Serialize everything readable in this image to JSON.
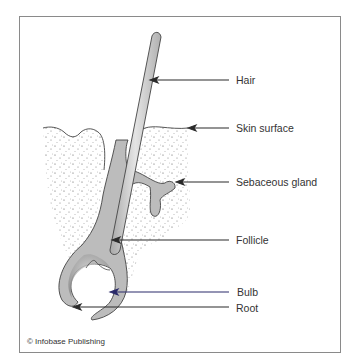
{
  "diagram": {
    "labels": [
      {
        "id": "hair",
        "text": "Hair"
      },
      {
        "id": "skin_surface",
        "text": "Skin surface"
      },
      {
        "id": "sebaceous_gland",
        "text": "Sebaceous gland"
      },
      {
        "id": "follicle",
        "text": "Follicle"
      },
      {
        "id": "bulb",
        "text": "Bulb"
      },
      {
        "id": "root",
        "text": "Root"
      }
    ],
    "credit": "© Infobase Publishing",
    "colors": {
      "frame": "#8a8a8a",
      "outline": "#444444",
      "hair_fill": "#c8c8c8",
      "follicle_fill": "#b8b8b8",
      "arrow": "#2a2a2a",
      "bulb_arrow": "#2a2a6a",
      "dermis_dots": "#555555"
    }
  }
}
